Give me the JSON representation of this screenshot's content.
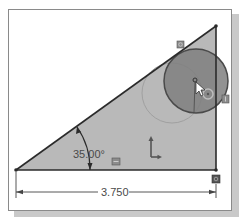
{
  "sketch": {
    "angle_dimension": "35.00°",
    "linear_dimension": "3.750",
    "colors": {
      "triangle_fill": "#b9b9b9",
      "edge": "#2b2b2b",
      "selected_circle_fill": "#7d7d7d",
      "ghost_circle": "#9a9a9a",
      "frame_border": "#8a8a8a"
    },
    "icons": [
      "origin-axes-icon",
      "relation-horizontal-icon",
      "relation-vertical-icon",
      "relation-coincident-icon",
      "relation-tangent-icon",
      "cursor-arrow-icon"
    ]
  }
}
